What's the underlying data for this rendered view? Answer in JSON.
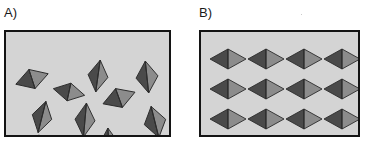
{
  "figure": {
    "kind": "two-panel-schematic",
    "background_color": "#ffffff",
    "panel_fill_color": "#d4d4d4",
    "panel_border_color": "#141414",
    "shape_dark_color": "#4a4a4a",
    "shape_light_color": "#8c8c8c",
    "shape_outline_color": "#2b2b2b",
    "shape_name": "bipyramid-diamond"
  },
  "panels": [
    {
      "id": "panel-a",
      "label": "A)",
      "label_name": "panel-a-label",
      "arrangement": "random-disordered",
      "shape_count": 14,
      "box": {
        "x": 4,
        "y": 30,
        "width": 167,
        "height": 107
      },
      "shapes": [
        {
          "cx": 26,
          "cy": 47,
          "rx": 17,
          "ry": 10,
          "rotation": -18
        },
        {
          "cx": 63,
          "cy": 60,
          "rx": 16,
          "ry": 9,
          "rotation": 12
        },
        {
          "cx": 92,
          "cy": 44,
          "rx": 10,
          "ry": 16,
          "rotation": 8
        },
        {
          "cx": 141,
          "cy": 45,
          "rx": 11,
          "ry": 16,
          "rotation": -6
        },
        {
          "cx": 113,
          "cy": 66,
          "rx": 17,
          "ry": 10,
          "rotation": -20
        },
        {
          "cx": 36,
          "cy": 85,
          "rx": 10,
          "ry": 16,
          "rotation": 14
        },
        {
          "cx": 79,
          "cy": 88,
          "rx": 10,
          "ry": 17,
          "rotation": 5
        },
        {
          "cx": 149,
          "cy": 90,
          "rx": 11,
          "ry": 16,
          "rotation": -14
        },
        {
          "cx": 27,
          "cy": 118,
          "rx": 11,
          "ry": 16,
          "rotation": 22
        },
        {
          "cx": 62,
          "cy": 120,
          "rx": 17,
          "ry": 10,
          "rotation": 10
        },
        {
          "cx": 103,
          "cy": 112,
          "rx": 10,
          "ry": 16,
          "rotation": -4
        },
        {
          "cx": 140,
          "cy": 126,
          "rx": 16,
          "ry": 10,
          "rotation": -22
        },
        {
          "cx": 55,
          "cy": 37,
          "rx": 0,
          "ry": 0,
          "rotation": 0
        },
        {
          "cx": 0,
          "cy": 0,
          "rx": 0,
          "ry": 0,
          "rotation": 0
        }
      ]
    },
    {
      "id": "panel-b",
      "label": "B)",
      "label_name": "panel-b-label",
      "arrangement": "ordered-aligned-grid",
      "grid_columns": 4,
      "grid_rows": 3,
      "shape_count": 12,
      "box": {
        "x": 199,
        "y": 30,
        "width": 161,
        "height": 107
      },
      "shapes": [
        {
          "cx": 27,
          "cy": 27,
          "rx": 18,
          "ry": 10,
          "rotation": 0
        },
        {
          "cx": 65,
          "cy": 27,
          "rx": 18,
          "ry": 10,
          "rotation": 0
        },
        {
          "cx": 103,
          "cy": 27,
          "rx": 18,
          "ry": 10,
          "rotation": 0
        },
        {
          "cx": 141,
          "cy": 27,
          "rx": 18,
          "ry": 10,
          "rotation": 0
        },
        {
          "cx": 27,
          "cy": 57,
          "rx": 18,
          "ry": 10,
          "rotation": 0
        },
        {
          "cx": 65,
          "cy": 57,
          "rx": 18,
          "ry": 10,
          "rotation": 0
        },
        {
          "cx": 103,
          "cy": 57,
          "rx": 18,
          "ry": 10,
          "rotation": 0
        },
        {
          "cx": 141,
          "cy": 57,
          "rx": 18,
          "ry": 10,
          "rotation": 0
        },
        {
          "cx": 27,
          "cy": 87,
          "rx": 18,
          "ry": 10,
          "rotation": 0
        },
        {
          "cx": 65,
          "cy": 87,
          "rx": 18,
          "ry": 10,
          "rotation": 0
        },
        {
          "cx": 103,
          "cy": 87,
          "rx": 18,
          "ry": 10,
          "rotation": 0
        },
        {
          "cx": 141,
          "cy": 87,
          "rx": 18,
          "ry": 10,
          "rotation": 0
        }
      ]
    }
  ]
}
